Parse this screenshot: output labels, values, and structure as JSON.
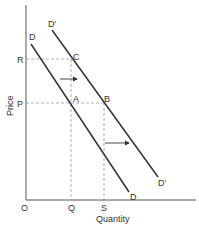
{
  "diagram": {
    "type": "economics-demand-shift",
    "axes": {
      "x_label": "Quantity",
      "y_label": "Price",
      "origin_label": "O"
    },
    "x_ticks": [
      {
        "label": "Q"
      },
      {
        "label": "S"
      }
    ],
    "y_ticks": [
      {
        "label": "R"
      },
      {
        "label": "P"
      }
    ],
    "curves": [
      {
        "name": "D",
        "label_top": "D",
        "label_bottom": "D"
      },
      {
        "name": "D'",
        "label_top": "D′",
        "label_bottom": "D′"
      }
    ],
    "points": [
      {
        "label": "A"
      },
      {
        "label": "B"
      },
      {
        "label": "C"
      }
    ],
    "arrows": [
      "shift-right-upper",
      "shift-right-lower"
    ],
    "colors": {
      "line": "#333333",
      "dashed": "#999999",
      "background": "#ffffff"
    }
  }
}
